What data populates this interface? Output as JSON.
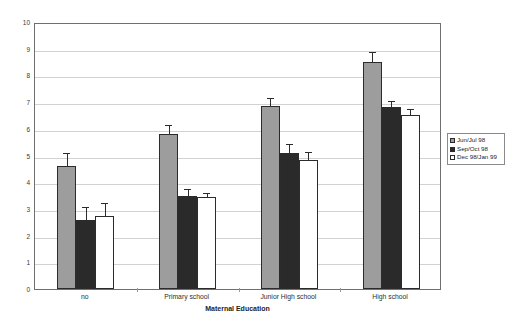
{
  "chart_data": {
    "type": "bar",
    "title": "",
    "xlabel": "Maternal Education",
    "ylabel": "",
    "ylim": [
      0,
      10
    ],
    "ytick_step": 1,
    "grid": true,
    "legend_position": "right-outside",
    "error_bars": "upper-only",
    "categories": [
      "no",
      "Primary school",
      "Junior High school",
      "High school"
    ],
    "yticks": [
      "0",
      "1",
      "2",
      "3",
      "4",
      "5",
      "6",
      "7",
      "8",
      "9",
      "10"
    ],
    "series": [
      {
        "name": "Jun/Jul 98",
        "color": "#9d9d9d",
        "values": [
          4.6,
          5.8,
          6.85,
          8.5
        ],
        "errors": [
          0.45,
          0.3,
          0.25,
          0.35
        ]
      },
      {
        "name": "Sep/Oct 98",
        "color": "#2a2a2a",
        "values": [
          2.6,
          3.5,
          5.1,
          6.8
        ],
        "errors": [
          0.45,
          0.2,
          0.28,
          0.22
        ]
      },
      {
        "name": "Dec 98/Jan 99",
        "color": "#ffffff",
        "values": [
          2.75,
          3.45,
          4.85,
          6.5
        ],
        "errors": [
          0.45,
          0.12,
          0.25,
          0.2
        ]
      }
    ]
  }
}
